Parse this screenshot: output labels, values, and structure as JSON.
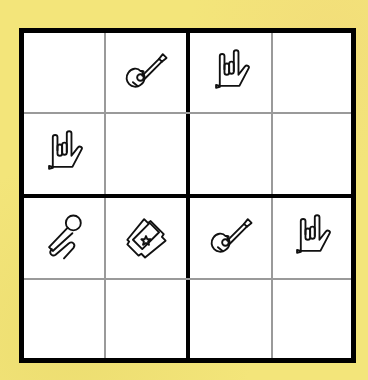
{
  "puzzle": {
    "type": "picture-sudoku-4x4",
    "size": 4,
    "colors": {
      "background": "#f3e57a",
      "board": "#ffffff",
      "border": "#000000",
      "thin_line": "#9a9a9a"
    },
    "grid": [
      [
        "",
        "guitar-icon",
        "rock-hand-icon",
        ""
      ],
      [
        "rock-hand-icon",
        "",
        "",
        ""
      ],
      [
        "microphone-icon",
        "ticket-icon",
        "guitar-icon",
        "rock-hand-icon"
      ],
      [
        "",
        "",
        "",
        ""
      ]
    ]
  }
}
